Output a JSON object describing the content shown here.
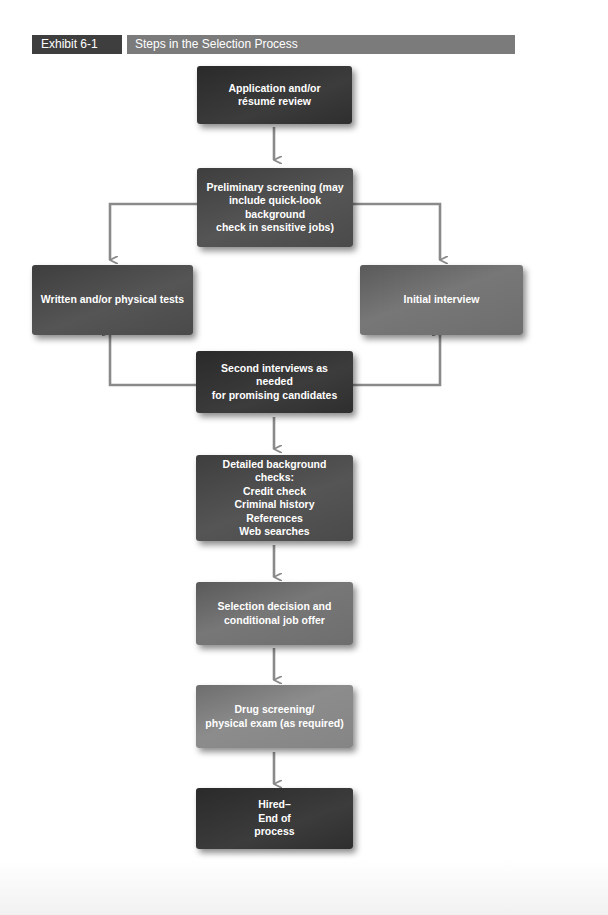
{
  "exhibit": {
    "label": "Exhibit 6-1",
    "title": "Steps in the Selection Process"
  },
  "colors": {
    "arrow": "#8a8a8a",
    "label_bg": "#3e3e3e",
    "title_bg": "#7b7b7b",
    "text": "#ffffff"
  },
  "steps": {
    "application": {
      "lines": [
        "Application and/or",
        "résumé review"
      ]
    },
    "preliminary": {
      "lines": [
        "Preliminary screening (may",
        "include quick-look background",
        "check in sensitive jobs)"
      ]
    },
    "written_tests": {
      "lines": [
        "Written and/or physical tests"
      ]
    },
    "initial_interview": {
      "lines": [
        "Initial interview"
      ]
    },
    "second_interviews": {
      "lines": [
        "Second interviews as needed",
        "for promising candidates"
      ]
    },
    "background_checks": {
      "lines": [
        "Detailed background checks:",
        "Credit check",
        "Criminal history",
        "References",
        "Web searches"
      ]
    },
    "selection_decision": {
      "lines": [
        "Selection decision and",
        "conditional job offer"
      ]
    },
    "drug_screening": {
      "lines": [
        "Drug screening/",
        "physical exam (as required)"
      ]
    },
    "hired": {
      "lines": [
        "Hired–",
        "End of",
        "process"
      ]
    }
  },
  "flow": [
    [
      "application",
      "preliminary"
    ],
    [
      "preliminary",
      "written_tests"
    ],
    [
      "preliminary",
      "initial_interview"
    ],
    [
      "second_interviews",
      "written_tests"
    ],
    [
      "second_interviews",
      "initial_interview"
    ],
    [
      "second_interviews",
      "background_checks"
    ],
    [
      "background_checks",
      "selection_decision"
    ],
    [
      "selection_decision",
      "drug_screening"
    ],
    [
      "drug_screening",
      "hired"
    ]
  ]
}
